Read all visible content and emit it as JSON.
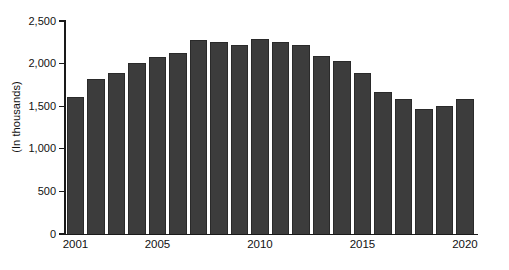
{
  "chart_data": {
    "type": "bar",
    "title": "",
    "subtitle": "",
    "xlabel": "",
    "ylabel": "(In thousands)",
    "ylim": [
      0,
      2500
    ],
    "ytick_values": [
      0,
      500,
      1000,
      1500,
      2000,
      2500
    ],
    "ytick_labels": [
      "0",
      "500",
      "1,000",
      "1,500",
      "2,000",
      "2,500"
    ],
    "grid": false,
    "legend": "none",
    "categories": [
      "2001",
      "2002",
      "2003",
      "2004",
      "2005",
      "2006",
      "2007",
      "2008",
      "2009",
      "2010",
      "2011",
      "2012",
      "2013",
      "2014",
      "2015",
      "2016",
      "2017",
      "2018",
      "2019",
      "2020"
    ],
    "xtick_labels": [
      "2001",
      "2005",
      "2010",
      "2015",
      "2020"
    ],
    "values": [
      1610,
      1815,
      1895,
      2005,
      2075,
      2120,
      2275,
      2255,
      2220,
      2285,
      2250,
      2215,
      2090,
      2025,
      1885,
      1665,
      1590,
      1470,
      1505,
      1590
    ],
    "series": [
      {
        "name": "",
        "values": [
          1610,
          1815,
          1895,
          2005,
          2075,
          2120,
          2275,
          2255,
          2220,
          2285,
          2250,
          2215,
          2090,
          2025,
          1885,
          1665,
          1590,
          1470,
          1505,
          1590
        ]
      }
    ],
    "bar_color": "#3c3c3c",
    "bar_edge_color": "#2a2a2a",
    "background_color": "#ffffff",
    "axis_color": "#1a1a1a"
  }
}
